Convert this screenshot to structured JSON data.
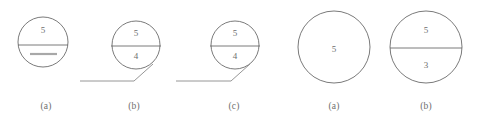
{
  "page": {
    "background_color": "#ffffff",
    "stroke_color": "#6b6b6b",
    "text_color": "#6e6e6e",
    "blank_bar_color": "#a8a8a8",
    "width": 478,
    "height": 123
  },
  "groups": [
    {
      "name": "left-group",
      "figures": [
        {
          "id": "fig-a-1",
          "caption": "(a)",
          "caption_x": 46,
          "caption_y": 101,
          "circle": {
            "cx": 43,
            "cy": 42,
            "r": 25
          },
          "divider": {
            "x1": 18,
            "y1": 45,
            "x2": 68,
            "y2": 45
          },
          "top_value": "5",
          "top_value_x": 43,
          "top_value_y": 31,
          "bottom_value": "",
          "bottom_blank_bar": {
            "x1": 30,
            "y1": 54,
            "x2": 57,
            "y2": 54
          },
          "leader": null
        },
        {
          "id": "fig-b-1",
          "caption": "(b)",
          "caption_x": 134,
          "caption_y": 101,
          "circle": {
            "cx": 136,
            "cy": 45,
            "r": 24
          },
          "divider": {
            "x1": 111,
            "y1": 46,
            "x2": 161,
            "y2": 46
          },
          "top_value": "5",
          "top_value_x": 136,
          "top_value_y": 34,
          "bottom_value": "4",
          "bottom_value_x": 136,
          "bottom_value_y": 57,
          "leader": {
            "points": "80,81 134,81 153,64"
          }
        },
        {
          "id": "fig-c-1",
          "caption": "(c)",
          "caption_x": 234,
          "caption_y": 101,
          "circle": {
            "cx": 235,
            "cy": 45,
            "r": 24
          },
          "divider": {
            "x1": 210,
            "y1": 46,
            "x2": 260,
            "y2": 46
          },
          "top_value": "5",
          "top_value_x": 235,
          "top_value_y": 34,
          "bottom_value": "4",
          "bottom_value_x": 235,
          "bottom_value_y": 57,
          "leader": {
            "points": "176,81 231,81 250,64"
          }
        }
      ]
    },
    {
      "name": "right-group",
      "figures": [
        {
          "id": "fig-a-2",
          "caption": "(a)",
          "caption_x": 334,
          "caption_y": 101,
          "circle": {
            "cx": 334,
            "cy": 47,
            "r": 36
          },
          "divider": null,
          "top_value": "5",
          "top_value_x": 334,
          "top_value_y": 50,
          "bottom_value": "",
          "leader": null
        },
        {
          "id": "fig-b-2",
          "caption": "(b)",
          "caption_x": 426,
          "caption_y": 101,
          "circle": {
            "cx": 426,
            "cy": 47,
            "r": 36
          },
          "divider": {
            "x1": 390,
            "y1": 48,
            "x2": 462,
            "y2": 48
          },
          "top_value": "5",
          "top_value_x": 426,
          "top_value_y": 31,
          "bottom_value": "3",
          "bottom_value_x": 426,
          "bottom_value_y": 66,
          "leader": null
        }
      ]
    }
  ]
}
